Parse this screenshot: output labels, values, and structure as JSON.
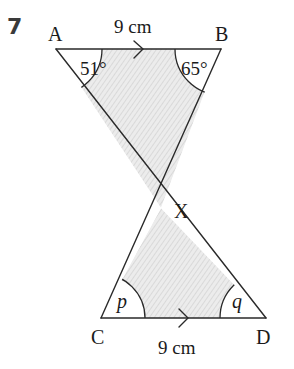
{
  "question": {
    "number": "7"
  },
  "diagram": {
    "vertices": {
      "A": "A",
      "B": "B",
      "C": "C",
      "D": "D",
      "X": "X"
    },
    "lengths": {
      "AB": "9 cm",
      "CD": "9 cm"
    },
    "angles": {
      "A": "51°",
      "B": "65°",
      "C": "p",
      "D": "q"
    },
    "colors": {
      "line": "#2a2a2a",
      "shade": "#e6e6e6",
      "hatch": "#cfcfcf"
    }
  }
}
